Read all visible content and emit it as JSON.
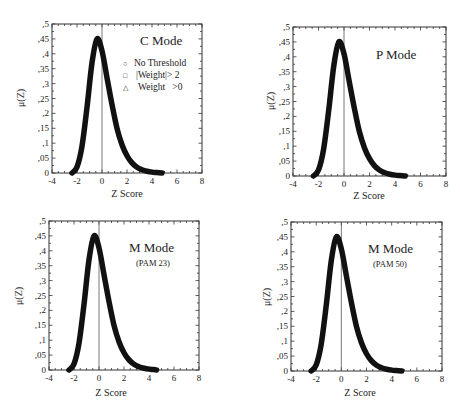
{
  "chart_data": [
    {
      "type": "scatter",
      "title": "C Mode",
      "subtitle": "",
      "xlabel": "Z Score",
      "ylabel": "μ(Z)",
      "xlim": [
        -4,
        8
      ],
      "ylim": [
        0,
        0.5
      ],
      "xticks": [
        "-4",
        "-2",
        "0",
        "2",
        "4",
        "6",
        "8"
      ],
      "yticks": [
        "0",
        ",05",
        ",1",
        ",15",
        ",2",
        ",25",
        ",3",
        ",35",
        ",4",
        ",45",
        ",5"
      ],
      "reference_line_x": 0,
      "legend": [
        "No Threshold",
        "|Weight|> 2",
        "Weight   >0"
      ],
      "legend_markers": [
        "circle",
        "square",
        "triangle"
      ],
      "legend_position": "upper right",
      "peak": {
        "x": -0.4,
        "y": 0.45
      },
      "support": [
        -2.4,
        4.8
      ],
      "x": [
        -2.4,
        -2.0,
        -1.6,
        -1.2,
        -0.8,
        -0.4,
        0.0,
        0.4,
        0.8,
        1.2,
        1.6,
        2.0,
        2.4,
        2.8,
        3.2,
        3.6,
        4.0,
        4.4,
        4.8
      ],
      "values": [
        0.0,
        0.02,
        0.09,
        0.22,
        0.37,
        0.45,
        0.41,
        0.32,
        0.23,
        0.15,
        0.095,
        0.058,
        0.034,
        0.019,
        0.011,
        0.006,
        0.003,
        0.0015,
        0.0
      ]
    },
    {
      "type": "scatter",
      "title": "P Mode",
      "subtitle": "",
      "xlabel": "Z Score",
      "ylabel": "μ(Z)",
      "xlim": [
        -4,
        8
      ],
      "ylim": [
        0,
        0.5
      ],
      "xticks": [
        "-4",
        "-2",
        "0",
        "2",
        "4",
        "6",
        "8"
      ],
      "yticks": [
        "0",
        ",05",
        ",1",
        ",15",
        ",2",
        ",25",
        ",3",
        ",35",
        ",4",
        ",45",
        ",5"
      ],
      "reference_line_x": 0,
      "peak": {
        "x": -0.4,
        "y": 0.45
      },
      "support": [
        -2.4,
        4.8
      ],
      "x": [
        -2.4,
        -2.0,
        -1.6,
        -1.2,
        -0.8,
        -0.4,
        0.0,
        0.4,
        0.8,
        1.2,
        1.6,
        2.0,
        2.4,
        2.8,
        3.2,
        3.6,
        4.0,
        4.4,
        4.8
      ],
      "values": [
        0.0,
        0.02,
        0.09,
        0.22,
        0.37,
        0.45,
        0.41,
        0.32,
        0.23,
        0.15,
        0.095,
        0.058,
        0.034,
        0.019,
        0.011,
        0.006,
        0.003,
        0.0015,
        0.0
      ]
    },
    {
      "type": "scatter",
      "title": "M Mode",
      "subtitle": "(PAM 23)",
      "xlabel": "Z Score",
      "ylabel": "μ(Z)",
      "xlim": [
        -4,
        8
      ],
      "ylim": [
        0,
        0.5
      ],
      "xticks": [
        "-4",
        "-2",
        "0",
        "2",
        "4",
        "6",
        "8"
      ],
      "yticks": [
        "0",
        ",05",
        ",1",
        ",15",
        ",2",
        ",25",
        ",3",
        ",35",
        ",4",
        ",45",
        ",5"
      ],
      "reference_line_x": 0,
      "peak": {
        "x": -0.4,
        "y": 0.45
      },
      "support": [
        -2.4,
        4.6
      ],
      "x": [
        -2.4,
        -2.0,
        -1.6,
        -1.2,
        -0.8,
        -0.4,
        0.0,
        0.4,
        0.8,
        1.2,
        1.6,
        2.0,
        2.4,
        2.8,
        3.2,
        3.6,
        4.0,
        4.4,
        4.6
      ],
      "values": [
        0.0,
        0.02,
        0.09,
        0.22,
        0.37,
        0.45,
        0.41,
        0.32,
        0.23,
        0.15,
        0.095,
        0.058,
        0.034,
        0.019,
        0.011,
        0.006,
        0.003,
        0.0015,
        0.0
      ]
    },
    {
      "type": "scatter",
      "title": "M Mode",
      "subtitle": "(PAM 50)",
      "xlabel": "Z Score",
      "ylabel": "μ(Z)",
      "xlim": [
        -4,
        8
      ],
      "ylim": [
        0,
        0.5
      ],
      "xticks": [
        "-4",
        "-2",
        "0",
        "2",
        "4",
        "6",
        "8"
      ],
      "yticks": [
        "0",
        ",05",
        ",1",
        ",15",
        ",2",
        ",25",
        ",3",
        ",35",
        ",4",
        ",45",
        ",5"
      ],
      "reference_line_x": 0,
      "peak": {
        "x": -0.4,
        "y": 0.45
      },
      "support": [
        -2.4,
        4.8
      ],
      "x": [
        -2.4,
        -2.0,
        -1.6,
        -1.2,
        -0.8,
        -0.4,
        0.0,
        0.4,
        0.8,
        1.2,
        1.6,
        2.0,
        2.4,
        2.8,
        3.2,
        3.6,
        4.0,
        4.4,
        4.8
      ],
      "values": [
        0.0,
        0.02,
        0.09,
        0.22,
        0.37,
        0.45,
        0.41,
        0.32,
        0.23,
        0.15,
        0.095,
        0.058,
        0.034,
        0.019,
        0.011,
        0.006,
        0.003,
        0.0015,
        0.0
      ]
    }
  ],
  "panels": [
    {
      "title": "C Mode",
      "subtitle": "",
      "xlabel": "Z Score",
      "ylabel": "μ(Z)",
      "legend": [
        {
          "marker": "○",
          "label": "No Threshold"
        },
        {
          "marker": "□",
          "label": "|Weight|> 2"
        },
        {
          "marker": "△",
          "label": "Weight   >0"
        }
      ]
    },
    {
      "title": "P Mode",
      "subtitle": "",
      "xlabel": "Z Score",
      "ylabel": "μ(Z)"
    },
    {
      "title": "M Mode",
      "subtitle": "(PAM 23)",
      "xlabel": "Z Score",
      "ylabel": "μ(Z)"
    },
    {
      "title": "M Mode",
      "subtitle": "(PAM 50)",
      "xlabel": "Z Score",
      "ylabel": "μ(Z)"
    }
  ],
  "style": {
    "curve_color": "#111111",
    "axis_color": "#333333",
    "background": "#ffffff"
  }
}
